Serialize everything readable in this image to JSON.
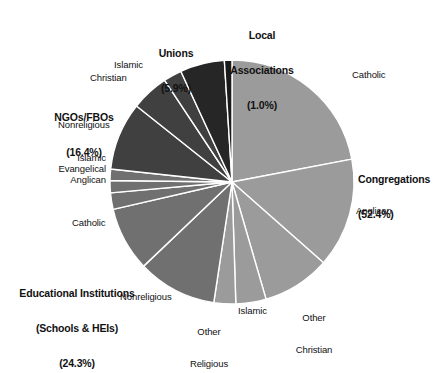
{
  "chart_data": {
    "type": "pie",
    "title": "",
    "subtitle": "",
    "xlabel": "",
    "ylabel": "",
    "legend_position": "none",
    "grid": false,
    "units": "percent",
    "start_angle_deg": 0,
    "direction": "clockwise",
    "center": {
      "x": 232,
      "y": 182
    },
    "radius": 122,
    "groups": [
      {
        "name": "Congregations",
        "percent_label": "(52.4%)",
        "value": 52.4
      },
      {
        "name": "Educational Institutions\n(Schools & HEIs)",
        "percent_label": "(24.3%)",
        "value": 24.3
      },
      {
        "name": "NGOs/FBOs",
        "percent_label": "(16.4%)",
        "value": 16.4
      },
      {
        "name": "Unions",
        "percent_label": "(5.9%)",
        "value": 5.9
      },
      {
        "name": "Local Associations",
        "percent_label": "(1.0%)",
        "value": 1.0
      }
    ],
    "categories": [
      "Catholic",
      "Anglican",
      "Other Christian",
      "Islamic",
      "Other Religious",
      "Nonreligious",
      "Catholic",
      "Anglican",
      "Evangelical",
      "Islamic",
      "Nonreligious",
      "Christian",
      "Islamic",
      "Unions",
      "Local Associations"
    ],
    "values": [
      22.0,
      14.5,
      9.0,
      4.0,
      2.9,
      10.5,
      8.5,
      2.2,
      1.6,
      1.5,
      9.0,
      5.0,
      2.4,
      5.9,
      1.0
    ],
    "slices": [
      {
        "label": "Catholic",
        "group": "Congregations",
        "value": 22.0,
        "color": "#9b9b9b",
        "start_deg": 0.0,
        "end_deg": 79.2
      },
      {
        "label": "Anglican",
        "group": "Congregations",
        "value": 14.5,
        "color": "#9b9b9b",
        "start_deg": 79.2,
        "end_deg": 131.4
      },
      {
        "label": "Other Christian",
        "group": "Congregations",
        "value": 9.0,
        "color": "#9b9b9b",
        "start_deg": 131.4,
        "end_deg": 163.8
      },
      {
        "label": "Islamic",
        "group": "Congregations",
        "value": 4.0,
        "color": "#9b9b9b",
        "start_deg": 163.8,
        "end_deg": 178.2
      },
      {
        "label": "Other Religious",
        "group": "Congregations",
        "value": 2.9,
        "color": "#9b9b9b",
        "start_deg": 178.2,
        "end_deg": 188.6
      },
      {
        "label": "Nonreligious",
        "group": "Educational Institutions",
        "value": 10.5,
        "color": "#707070",
        "start_deg": 188.6,
        "end_deg": 226.4
      },
      {
        "label": "Catholic",
        "group": "Educational Institutions",
        "value": 8.5,
        "color": "#707070",
        "start_deg": 226.4,
        "end_deg": 257.0
      },
      {
        "label": "Anglican",
        "group": "Educational Institutions",
        "value": 2.2,
        "color": "#707070",
        "start_deg": 257.0,
        "end_deg": 264.9
      },
      {
        "label": "Evangelical",
        "group": "Educational Institutions",
        "value": 1.6,
        "color": "#707070",
        "start_deg": 264.9,
        "end_deg": 270.7
      },
      {
        "label": "Islamic",
        "group": "Educational Institutions",
        "value": 1.5,
        "color": "#707070",
        "start_deg": 270.7,
        "end_deg": 276.1
      },
      {
        "label": "Nonreligious",
        "group": "NGOs/FBOs",
        "value": 9.0,
        "color": "#404040",
        "start_deg": 276.1,
        "end_deg": 308.5
      },
      {
        "label": "Christian",
        "group": "NGOs/FBOs",
        "value": 5.0,
        "color": "#404040",
        "start_deg": 308.5,
        "end_deg": 326.5
      },
      {
        "label": "Islamic",
        "group": "NGOs/FBOs",
        "value": 2.4,
        "color": "#404040",
        "start_deg": 326.5,
        "end_deg": 335.2
      },
      {
        "label": "Unions",
        "group": "Unions",
        "value": 5.9,
        "color": "#262626",
        "start_deg": 335.2,
        "end_deg": 356.4
      },
      {
        "label": "Local Associations",
        "group": "Local Associations",
        "value": 1.0,
        "color": "#1a1a1a",
        "start_deg": 356.4,
        "end_deg": 360.0
      }
    ],
    "colors": {
      "congregations": "#9b9b9b",
      "educational": "#707070",
      "ngos_fbos": "#404040",
      "unions": "#262626",
      "local_associations": "#1a1a1a",
      "separator": "#ffffff",
      "background": "#ffffff",
      "text": "#111111"
    }
  },
  "labels": {
    "group_local_associations_l1": "Local",
    "group_local_associations_l2": "Associations",
    "group_local_associations_pct": "(1.0%)",
    "group_unions_l1": "Unions",
    "group_unions_pct": "(5.9%)",
    "group_ngos_l1": "NGOs/FBOs",
    "group_ngos_pct": "(16.4%)",
    "group_edu_l1": "Educational Institutions",
    "group_edu_l2": "(Schools & HEIs)",
    "group_edu_pct": "(24.3%)",
    "group_congregations_l1": "Congregations",
    "group_congregations_pct": "(52.4%)",
    "slice_ngo_islamic": "Islamic",
    "slice_ngo_christian": "Christian",
    "slice_ngo_nonreligious": "Nonreligious",
    "slice_edu_islamic": "Islamic",
    "slice_edu_evangelical": "Evangelical",
    "slice_edu_anglican": "Anglican",
    "slice_edu_catholic": "Catholic",
    "slice_edu_nonreligious": "Nonreligious",
    "slice_cong_other_religious_l1": "Other",
    "slice_cong_other_religious_l2": "Religious",
    "slice_cong_islamic": "Islamic",
    "slice_cong_other_christian_l1": "Other",
    "slice_cong_other_christian_l2": "Christian",
    "slice_cong_anglican": "Anglican",
    "slice_cong_catholic": "Catholic"
  }
}
